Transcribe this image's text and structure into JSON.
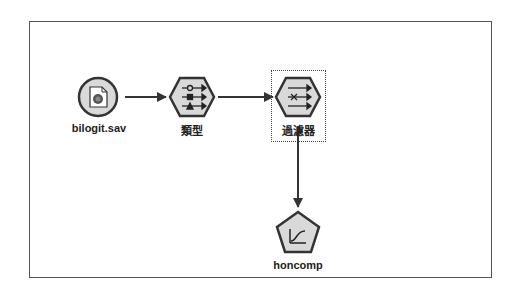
{
  "stream": {
    "nodes": [
      {
        "id": "source",
        "label": "bilogit.sav",
        "type": "statistics-file-source",
        "shape": "circle"
      },
      {
        "id": "type",
        "label": "類型",
        "type": "type-node",
        "shape": "hexagon"
      },
      {
        "id": "filter",
        "label": "過濾器",
        "type": "filter-node",
        "shape": "hexagon",
        "selected": true
      },
      {
        "id": "model",
        "label": "honcomp",
        "type": "logistic-model-nugget",
        "shape": "pentagon"
      }
    ],
    "links": [
      {
        "from": "source",
        "to": "type"
      },
      {
        "from": "type",
        "to": "filter"
      },
      {
        "from": "filter",
        "to": "model"
      }
    ]
  },
  "colors": {
    "node_fill": "#d9d9d9",
    "node_stroke": "#333333",
    "frame": "#555555",
    "arrow": "#333333"
  }
}
